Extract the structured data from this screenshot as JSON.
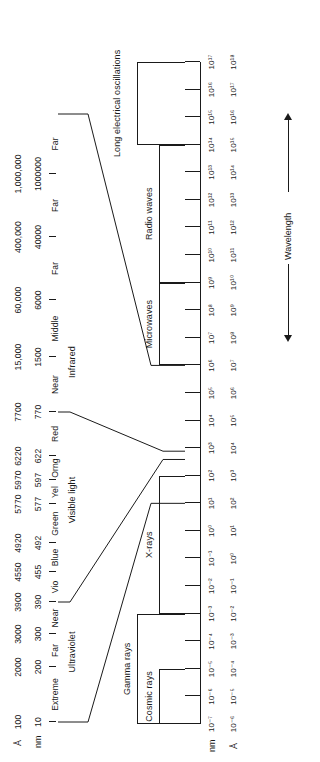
{
  "figure": {
    "wavelength_axis_label": "Wavelength",
    "line_color": "#1a1a1a",
    "background": "#ffffff"
  },
  "detail_scale": {
    "unit_row_1_label": "Å",
    "unit_row_2_label": "nm",
    "angstrom_values": [
      "100",
      "2000",
      "3000",
      "3900",
      "4550",
      "4920",
      "5770",
      "5970",
      "6220",
      "7700",
      "15,000",
      "60,000",
      "400,000",
      "1,000,000"
    ],
    "nm_values": [
      "10",
      "200",
      "300",
      "390",
      "455",
      "492",
      "577",
      "597",
      "622",
      "770",
      "1500",
      "6000",
      "40000",
      "1000000"
    ],
    "bands": [
      {
        "label": "Extreme",
        "group": "Ultraviolet"
      },
      {
        "label": "Far",
        "group": "Ultraviolet"
      },
      {
        "label": "Near",
        "group": "Ultraviolet"
      },
      {
        "label": "Vio",
        "group": "Visible light"
      },
      {
        "label": "Blue",
        "group": "Visible light"
      },
      {
        "label": "Green",
        "group": "Visible light"
      },
      {
        "label": "Yel",
        "group": "Visible light"
      },
      {
        "label": "Orng",
        "group": "Visible light"
      },
      {
        "label": "Red",
        "group": "Visible light"
      },
      {
        "label": "Near",
        "group": "Infrared"
      },
      {
        "label": "Middle",
        "group": "Infrared"
      },
      {
        "label": "Far",
        "group": "Infrared"
      },
      {
        "label": "Far",
        "group": "Infrared"
      },
      {
        "label": "Far",
        "group": "Infrared"
      }
    ],
    "group_labels": [
      "Ultraviolet",
      "Visible light",
      "Infrared"
    ]
  },
  "main_scale": {
    "unit_row_1_label": "nm",
    "unit_row_2_label": "Å",
    "nm_ticks": [
      "10⁻⁷",
      "10⁻⁶",
      "10⁻⁵",
      "10⁻⁴",
      "10⁻³",
      "10⁻²",
      "10⁻¹",
      "10⁰",
      "10¹",
      "10²",
      "10³",
      "10⁴",
      "10⁵",
      "10⁶",
      "10⁷",
      "10⁸",
      "10⁹",
      "10¹⁰",
      "10¹¹",
      "10¹²",
      "10¹³",
      "10¹⁴",
      "10¹⁵",
      "10¹⁶",
      "10¹⁷"
    ],
    "angstrom_ticks": [
      "10⁻⁶",
      "10⁻⁵",
      "10⁻⁴",
      "10⁻³",
      "10⁻²",
      "10⁻¹",
      "10⁰",
      "10¹",
      "10²",
      "10³",
      "10⁴",
      "10⁵",
      "10⁶",
      "10⁷",
      "10⁸",
      "10⁹",
      "10¹⁰",
      "10¹¹",
      "10¹²",
      "10¹³",
      "10¹⁴",
      "10¹⁵",
      "10¹⁶",
      "10¹⁷",
      "10¹⁸"
    ],
    "regions": [
      {
        "label": "Cosmic rays",
        "start_nm_exp": -7,
        "end_nm_exp": -5,
        "level": 1
      },
      {
        "label": "Gamma rays",
        "start_nm_exp": -7,
        "end_nm_exp": -3,
        "level": 2
      },
      {
        "label": "X-rays",
        "start_nm_exp": -3,
        "end_nm_exp": 2,
        "level": 1
      },
      {
        "label": "Microwaves",
        "start_nm_exp": 6,
        "end_nm_exp": 9,
        "level": 1
      },
      {
        "label": "Radio waves",
        "start_nm_exp": 9,
        "end_nm_exp": 14,
        "level": 1
      },
      {
        "label": "Long electrical oscillations",
        "start_nm_exp": 14,
        "end_nm_exp": 17,
        "level": 2
      }
    ]
  },
  "callouts": [
    {
      "name": "uv-left-leader"
    },
    {
      "name": "uv-vis-leader"
    },
    {
      "name": "vis-ir-leader"
    },
    {
      "name": "ir-right-leader"
    }
  ]
}
